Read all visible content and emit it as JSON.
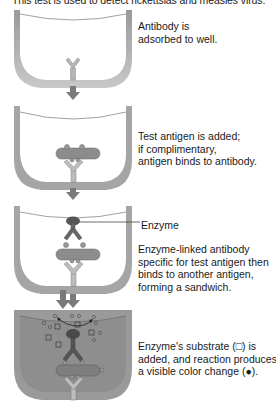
{
  "title": "This test is used to detect rickettsias and measles virus.",
  "steps": [
    {
      "id": 1,
      "lines": [
        "Antibody is",
        "adsorbed to well."
      ]
    },
    {
      "id": 2,
      "lines": [
        "Test antigen is added;",
        "if complimentary,",
        "antigen binds to antibody."
      ]
    },
    {
      "id": 3,
      "callout": "Enzyme",
      "lines": [
        "Enzyme-linked antibody",
        "specific for test antigen then",
        "binds to another antigen,",
        "forming a sandwich."
      ]
    },
    {
      "id": 4,
      "lines": [
        "Enzyme's substrate (□) is",
        "added, and reaction produces",
        "a visible color change (●)."
      ]
    }
  ],
  "colors": {
    "well_wall": "#8a8a8a",
    "well_fill_final": "#9a9a9a",
    "antibody": "#b8b8b8",
    "antigen": "#8c8c8c",
    "enzyme": "#555555",
    "arrow": "#7a7a7a"
  }
}
